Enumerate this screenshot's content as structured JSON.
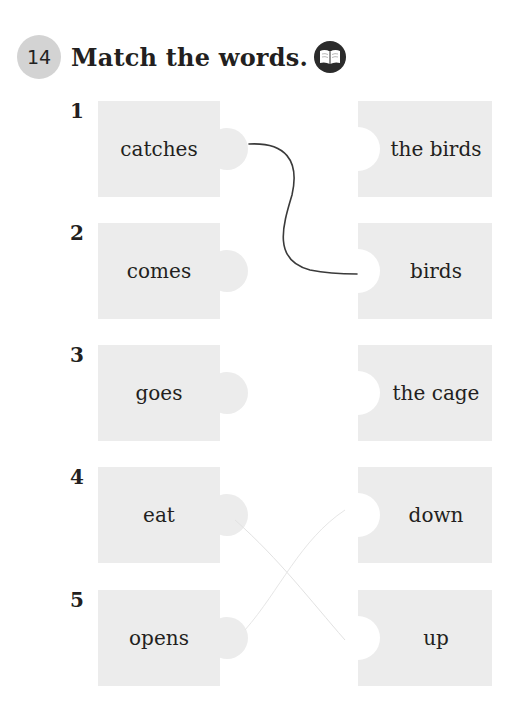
{
  "exercise": {
    "number": "14",
    "title": "Match the words.",
    "icon": "book-icon",
    "colors": {
      "badge": "#d3d3d3",
      "piece": "#ececec",
      "text": "#231f20",
      "icon_bg": "#2b2b2b"
    }
  },
  "rows": [
    {
      "number": "1",
      "left": "catches",
      "right": "the birds"
    },
    {
      "number": "2",
      "left": "comes",
      "right": "birds"
    },
    {
      "number": "3",
      "left": "goes",
      "right": "the cage"
    },
    {
      "number": "4",
      "left": "eat",
      "right": "down"
    },
    {
      "number": "5",
      "left": "opens",
      "right": "up"
    }
  ],
  "drawn_matches": [
    {
      "from": "catches",
      "to": "birds"
    }
  ]
}
